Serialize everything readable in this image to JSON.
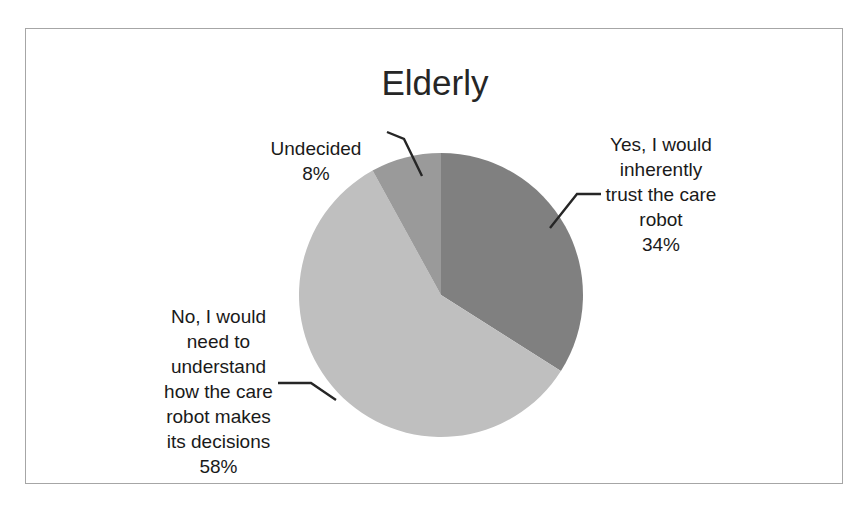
{
  "chart_data": {
    "type": "pie",
    "title": "Elderly",
    "subtitle": "",
    "xlabel": "",
    "ylabel": "",
    "grid": false,
    "legend_position": "none",
    "labels_position": "outside-with-leader-lines",
    "categories": [
      "Yes, I would inherently trust the care robot",
      "No, I would need to understand how the care robot makes its decisions",
      "Undecided"
    ],
    "values": [
      34,
      58,
      8
    ],
    "value_labels": [
      "34%",
      "58%",
      "8%"
    ],
    "unit": "%",
    "colors": [
      "#808080",
      "#bfbfbf",
      "#9a9a9a"
    ],
    "start_angle_deg": 0,
    "direction": "clockwise",
    "slices": [
      {
        "name": "Yes, I would inherently trust the care robot",
        "label_lines": "Yes, I would\ninherently\ntrust the care\nrobot",
        "percent_label": "34%",
        "value": 34,
        "color": "#808080",
        "start_deg": 0,
        "end_deg": 122.4
      },
      {
        "name": "No, I would need to understand how the care robot makes its decisions",
        "label_lines": "No, I would\nneed to\nunderstand\nhow the care\nrobot makes\nits decisions",
        "percent_label": "58%",
        "value": 58,
        "color": "#bfbfbf",
        "start_deg": 122.4,
        "end_deg": 331.2
      },
      {
        "name": "Undecided",
        "label_lines": "Undecided",
        "percent_label": "8%",
        "value": 8,
        "color": "#9a9a9a",
        "start_deg": 331.2,
        "end_deg": 360
      }
    ]
  },
  "chart": {
    "title": "Elderly",
    "border_color": "#a6a6a6",
    "background": "#ffffff"
  },
  "labels": {
    "undecided": {
      "text": "Undecided",
      "percent": "8%"
    },
    "yes": {
      "text": "Yes, I would\ninherently\ntrust the care\nrobot",
      "percent": "34%"
    },
    "no": {
      "text": "No, I would\nneed to\nunderstand\nhow the care\nrobot makes\nits decisions",
      "percent": "58%"
    }
  }
}
